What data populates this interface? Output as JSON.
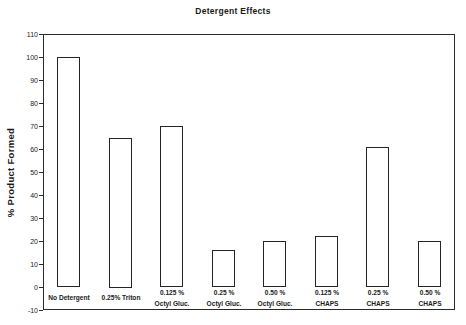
{
  "chart_data": {
    "type": "bar",
    "title": "Detergent Effects",
    "xlabel": "",
    "ylabel": "% Product Formed",
    "categories": [
      "No Detergent",
      "0.25% Triton",
      "0.125 %\nOctyl Gluc.",
      "0.25 %\nOctyl Gluc.",
      "0.50 %\nOctyl Gluc.",
      "0.125 %\nCHAPS",
      "0.25 %\nCHAPS",
      "0.50 %\nCHAPS"
    ],
    "values": [
      100,
      65,
      70,
      16,
      20,
      22,
      61,
      20
    ],
    "ylim": [
      -10,
      110
    ],
    "ytick_step": 10,
    "ytick_labels": [
      "110",
      "100",
      "90",
      "80",
      "70",
      "60",
      "50",
      "40",
      "30",
      "20",
      "10",
      "0",
      "-10"
    ],
    "grid": false,
    "legend": null,
    "bar_fill": "#ffffff",
    "bar_border": "#242424",
    "ink_color": "#1c1c1c",
    "background": "#ffffff"
  }
}
